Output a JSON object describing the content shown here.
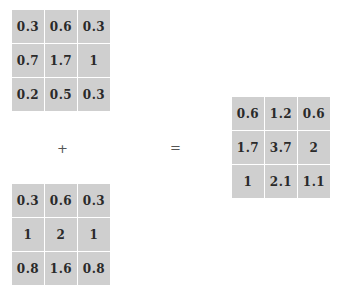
{
  "matrices": {
    "a": {
      "rows": [
        [
          "0.3",
          "0.6",
          "0.3"
        ],
        [
          "0.7",
          "1.7",
          "1"
        ],
        [
          "0.2",
          "0.5",
          "0.3"
        ]
      ]
    },
    "b": {
      "rows": [
        [
          "0.3",
          "0.6",
          "0.3"
        ],
        [
          "1",
          "2",
          "1"
        ],
        [
          "0.8",
          "1.6",
          "0.8"
        ]
      ]
    },
    "result": {
      "rows": [
        [
          "0.6",
          "1.2",
          "0.6"
        ],
        [
          "1.7",
          "3.7",
          "2"
        ],
        [
          "1",
          "2.1",
          "1.1"
        ]
      ]
    }
  },
  "operators": {
    "plus": "+",
    "equals": "="
  },
  "colors": {
    "cell_background": "#cfcfcf",
    "cell_text": "#2a2a2a",
    "grid_line": "#ffffff"
  }
}
